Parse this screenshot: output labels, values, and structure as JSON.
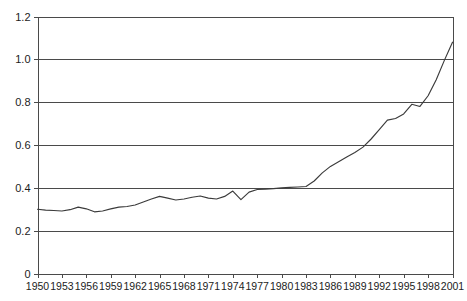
{
  "chart_data": {
    "type": "line",
    "title": "",
    "subtitle": "",
    "xlabel": "",
    "ylabel": "",
    "xlim": [
      1950,
      2001
    ],
    "ylim": [
      0,
      1.2
    ],
    "grid": true,
    "legend": false,
    "legend_position": "none",
    "y_ticks": [
      "0",
      "0.2",
      "0.4",
      "0.6",
      "0.8",
      "1.0",
      "1.2"
    ],
    "y_tick_values": [
      0,
      0.2,
      0.4,
      0.6,
      0.8,
      1.0,
      1.2
    ],
    "x_ticks": [
      "1950",
      "1953",
      "1956",
      "1959",
      "1962",
      "1965",
      "1968",
      "1971",
      "1974",
      "1977",
      "1980",
      "1983",
      "1986",
      "1989",
      "1992",
      "1995",
      "1998",
      "2001"
    ],
    "x_tick_values": [
      1950,
      1953,
      1956,
      1959,
      1962,
      1965,
      1968,
      1971,
      1974,
      1977,
      1980,
      1983,
      1986,
      1989,
      1992,
      1995,
      1998,
      2001
    ],
    "x": [
      1950,
      1951,
      1952,
      1953,
      1954,
      1955,
      1956,
      1957,
      1958,
      1959,
      1960,
      1961,
      1962,
      1963,
      1964,
      1965,
      1966,
      1967,
      1968,
      1969,
      1970,
      1971,
      1972,
      1973,
      1974,
      1975,
      1976,
      1977,
      1978,
      1979,
      1980,
      1981,
      1982,
      1983,
      1984,
      1985,
      1986,
      1987,
      1988,
      1989,
      1990,
      1991,
      1992,
      1993,
      1994,
      1995,
      1996,
      1997,
      1998,
      1999,
      2000,
      2001
    ],
    "series": [
      {
        "name": "series-1",
        "color": "#3b3b3b",
        "values": [
          0.3,
          0.296,
          0.294,
          0.292,
          0.298,
          0.31,
          0.302,
          0.288,
          0.292,
          0.302,
          0.31,
          0.313,
          0.32,
          0.334,
          0.348,
          0.36,
          0.352,
          0.343,
          0.348,
          0.356,
          0.362,
          0.352,
          0.348,
          0.36,
          0.385,
          0.345,
          0.38,
          0.392,
          0.394,
          0.396,
          0.4,
          0.402,
          0.404,
          0.406,
          0.432,
          0.47,
          0.5,
          0.522,
          0.544,
          0.565,
          0.59,
          0.628,
          0.672,
          0.716,
          0.724,
          0.745,
          0.79,
          0.78,
          0.83,
          0.905,
          0.995,
          1.08
        ]
      }
    ],
    "notes": {
      "line_color": "#3b3b3b",
      "grid_color": "#4a4a4a",
      "background": "#ffffff"
    }
  },
  "axes": {
    "y_axis_name": "value-axis",
    "x_axis_name": "year-axis"
  }
}
